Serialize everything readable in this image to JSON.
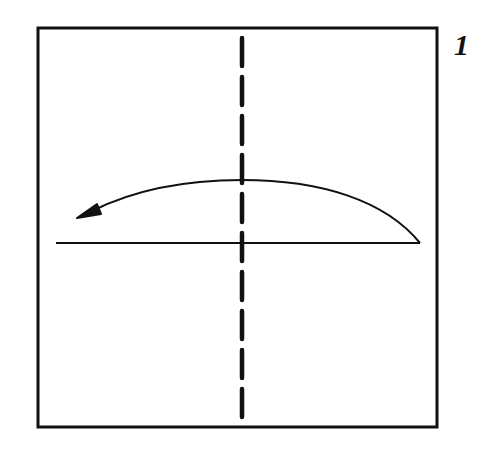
{
  "diagram": {
    "type": "origami-fold-instruction",
    "step_number": "1",
    "colors": {
      "background": "#ffffff",
      "ink": "#111111"
    },
    "paper_square": {
      "x1": 38,
      "y1": 28,
      "x2": 437,
      "y2": 427
    },
    "valley_fold_line": {
      "style": "dashed",
      "orientation": "vertical",
      "x": 242,
      "y1": 28,
      "y2": 427
    },
    "reference_line": {
      "orientation": "horizontal",
      "y": 243,
      "x1": 56,
      "x2": 420
    },
    "fold_arrow": {
      "direction": "right-to-left",
      "start": {
        "x": 420,
        "y": 243
      },
      "peak": {
        "x": 242,
        "y": 180
      },
      "end": {
        "x": 80,
        "y": 217
      }
    }
  }
}
